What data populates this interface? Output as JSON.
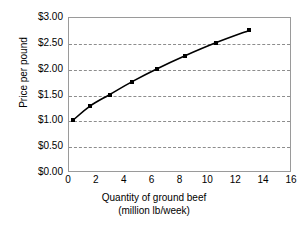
{
  "chart_data": {
    "type": "line",
    "title": "",
    "xlabel": "Quantity of ground beef (million lb/week)",
    "xlabel_line1": "Quantity of ground beef",
    "xlabel_line2": "(million lb/week)",
    "ylabel": "Price per pound",
    "xlim": [
      0,
      16
    ],
    "ylim": [
      0,
      3.0
    ],
    "xticks": [
      0,
      2,
      4,
      6,
      8,
      10,
      12,
      14,
      16
    ],
    "xtick_labels": [
      "0",
      "2",
      "4",
      "6",
      "8",
      "10",
      "12",
      "14",
      "16"
    ],
    "yticks": [
      0,
      0.5,
      1.0,
      1.5,
      2.0,
      2.5,
      3.0
    ],
    "ytick_labels": [
      "$0.00",
      "$0.50",
      "$1.00",
      "$1.50",
      "$2.00",
      "$2.50",
      "$3.00"
    ],
    "grid": "horizontal-dashed",
    "legend": "none",
    "series": [
      {
        "name": "Supply",
        "marker": "square",
        "color": "#000000",
        "x": [
          0.35,
          1.6,
          3.0,
          4.6,
          6.4,
          8.4,
          10.6,
          13.0
        ],
        "y": [
          1.0,
          1.28,
          1.5,
          1.75,
          2.0,
          2.25,
          2.5,
          2.74
        ]
      }
    ]
  },
  "axes": {
    "y_title": "Price per pound",
    "x_title_line1": "Quantity of ground beef",
    "x_title_line2": "(million lb/week)"
  },
  "colors": {
    "line": "#000000",
    "grid": "#8d8d8d",
    "frame": "#9a9a9a",
    "background": "#ffffff"
  }
}
